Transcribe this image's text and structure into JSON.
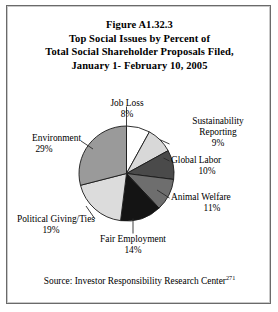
{
  "figure": {
    "title_lines": [
      "Figure A1.32.3",
      "Top Social Issues by Percent of",
      "Total Social Shareholder Proposals Filed,",
      "January 1- February 10, 2005"
    ],
    "source_text": "Source: Investor Responsibility Research Center",
    "source_footnote": "271"
  },
  "chart_data": {
    "type": "pie",
    "title": "Figure A1.32.3 Top Social Issues by Percent of Total Social Shareholder Proposals Filed, January 1- February 10, 2005",
    "xlabel": "",
    "ylabel": "",
    "legend": "none",
    "grid": false,
    "units": "percent",
    "start_angle_deg": 0,
    "direction": "clockwise",
    "categories": [
      "Job Loss",
      "Sustainability Reporting",
      "Global Labor",
      "Animal Welfare",
      "Fair Employment",
      "Political Giving/Ties",
      "Environment"
    ],
    "values": [
      8,
      9,
      10,
      11,
      14,
      19,
      29
    ],
    "value_labels": [
      "8%",
      "9%",
      "10%",
      "11%",
      "14%",
      "19%",
      "29%"
    ],
    "colors": [
      "#ffffff",
      "#d8d8d8",
      "#4a4a4a",
      "#6e6e6e",
      "#141414",
      "#dcdcdc",
      "#9a9a9a"
    ],
    "slices": [
      {
        "name": "Job Loss",
        "value": 8,
        "label": "Job Loss",
        "pct": "8%",
        "color": "#ffffff"
      },
      {
        "name": "Sustainability Reporting",
        "value": 9,
        "label": "Sustainability Reporting",
        "pct": "9%",
        "color": "#d8d8d8"
      },
      {
        "name": "Global Labor",
        "value": 10,
        "label": "Global Labor",
        "pct": "10%",
        "color": "#4a4a4a"
      },
      {
        "name": "Animal Welfare",
        "value": 11,
        "label": "Animal Welfare",
        "pct": "11%",
        "color": "#6e6e6e"
      },
      {
        "name": "Fair Employment",
        "value": 14,
        "label": "Fair Employment",
        "pct": "14%",
        "color": "#141414"
      },
      {
        "name": "Political Giving/Ties",
        "value": 19,
        "label": "Political Giving/Ties",
        "pct": "19%",
        "color": "#dcdcdc"
      },
      {
        "name": "Environment",
        "value": 29,
        "label": "Environment",
        "pct": "29%",
        "color": "#9a9a9a"
      }
    ],
    "total": 100
  },
  "labels": {
    "job_loss": {
      "name": "Job Loss",
      "pct": "8%"
    },
    "sustainability": {
      "name_1": "Sustainability",
      "name_2": "Reporting",
      "pct": "9%"
    },
    "global_labor": {
      "name": "Global Labor",
      "pct": "10%"
    },
    "animal_welfare": {
      "name": "Animal Welfare",
      "pct": "11%"
    },
    "fair_employment": {
      "name": "Fair Employment",
      "pct": "14%"
    },
    "political": {
      "name": "Political Giving/Ties",
      "pct": "19%"
    },
    "environment": {
      "name": "Environment",
      "pct": "29%"
    }
  }
}
